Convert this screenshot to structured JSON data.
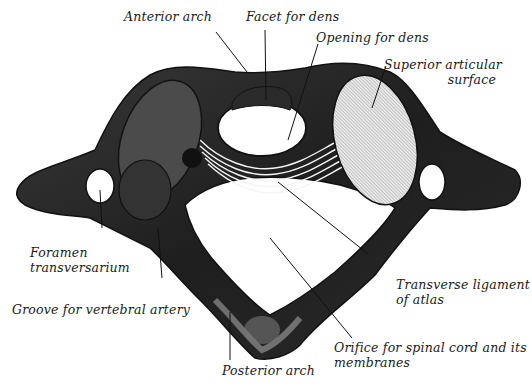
{
  "figure": {
    "background": "#ffffff",
    "ink": "#1a1a1a",
    "labels": [
      {
        "id": "anterior-arch",
        "lines": [
          "Anterior arch"
        ]
      },
      {
        "id": "facet-for-dens",
        "lines": [
          "Facet for dens"
        ]
      },
      {
        "id": "opening-for-dens",
        "lines": [
          "Opening for dens"
        ]
      },
      {
        "id": "superior-articular-surface",
        "lines": [
          "Superior articular",
          "surface"
        ]
      },
      {
        "id": "foramen-transversarium",
        "lines": [
          "Foramen",
          "transversarium"
        ]
      },
      {
        "id": "groove-for-vertebral-artery",
        "lines": [
          "Groove for vertebral artery"
        ]
      },
      {
        "id": "transverse-ligament-of-atlas",
        "lines": [
          "Transverse ligament",
          "of atlas"
        ]
      },
      {
        "id": "orifice-for-spinal-cord",
        "lines": [
          "Orifice for spinal cord and its",
          "membranes"
        ]
      },
      {
        "id": "posterior-arch",
        "lines": [
          "Posterior arch"
        ]
      }
    ]
  }
}
